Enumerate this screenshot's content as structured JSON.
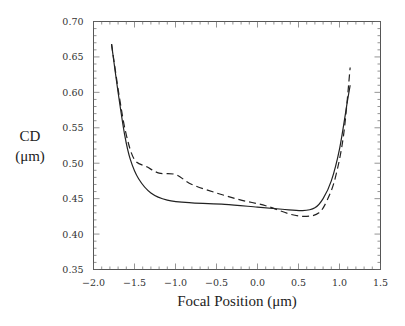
{
  "chart_data": {
    "type": "line",
    "title": "",
    "xlabel": "Focal Position (μm)",
    "ylabel_line1": "CD",
    "ylabel_line2": "(μm)",
    "xlim": [
      -2.0,
      1.5
    ],
    "ylim": [
      0.35,
      0.7
    ],
    "grid": false,
    "legend": "none",
    "x_ticks": [
      "-2.0",
      "-1.5",
      "-1.0",
      "-0.5",
      "0.0",
      "0.5",
      "1.0",
      "1.5"
    ],
    "x_tick_values": [
      -2.0,
      -1.5,
      -1.0,
      -0.5,
      0.0,
      0.5,
      1.0,
      1.5
    ],
    "y_ticks": [
      "0.35",
      "0.40",
      "0.45",
      "0.50",
      "0.55",
      "0.60",
      "0.65",
      "0.70"
    ],
    "y_tick_values": [
      0.35,
      0.4,
      0.45,
      0.5,
      0.55,
      0.6,
      0.65,
      0.7
    ],
    "series": [
      {
        "name": "solid",
        "style": "solid",
        "x": [
          -1.78,
          -1.7,
          -1.62,
          -1.55,
          -1.45,
          -1.3,
          -1.1,
          -0.8,
          -0.4,
          0.0,
          0.3,
          0.55,
          0.7,
          0.8,
          0.9,
          1.0,
          1.1,
          1.13
        ],
        "y": [
          0.668,
          0.6,
          0.54,
          0.505,
          0.478,
          0.458,
          0.448,
          0.444,
          0.442,
          0.438,
          0.435,
          0.433,
          0.437,
          0.45,
          0.475,
          0.52,
          0.59,
          0.61
        ]
      },
      {
        "name": "dashed",
        "style": "dashed",
        "x": [
          -1.78,
          -1.68,
          -1.6,
          -1.5,
          -1.35,
          -1.2,
          -1.0,
          -0.8,
          -0.5,
          -0.2,
          0.1,
          0.4,
          0.6,
          0.75,
          0.85,
          0.95,
          1.05,
          1.13
        ],
        "y": [
          0.668,
          0.59,
          0.54,
          0.505,
          0.495,
          0.486,
          0.484,
          0.47,
          0.458,
          0.448,
          0.44,
          0.428,
          0.425,
          0.43,
          0.448,
          0.48,
          0.54,
          0.635
        ]
      }
    ]
  }
}
